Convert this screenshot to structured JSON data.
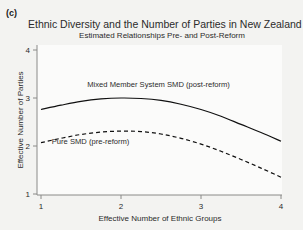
{
  "panel": {
    "label": "(c)"
  },
  "chart_data": {
    "type": "line",
    "title": "Ethnic Diversity and the Number of Parties in New Zealand",
    "subtitle": "Estimated Relationships Pre- and Post-Reform",
    "xlabel": "Effective Number of Ethnic Groups",
    "ylabel": "Effective Number of Parties",
    "xlim": [
      1,
      4
    ],
    "ylim": [
      1,
      4
    ],
    "xticks": [
      1,
      2,
      3,
      4
    ],
    "yticks": [
      1,
      2,
      3,
      4
    ],
    "xtick_labels": [
      "1",
      "2",
      "3",
      "4"
    ],
    "ytick_labels": [
      "1",
      "2",
      "3",
      "4"
    ],
    "grid": false,
    "legend_position": "inline-annotation",
    "series": [
      {
        "name": "Mixed Member System SMD (post-reform)",
        "style": "solid",
        "color": "#101010",
        "x": [
          1.0,
          1.25,
          1.5,
          1.75,
          2.0,
          2.25,
          2.5,
          2.75,
          3.0,
          3.25,
          3.5,
          3.75,
          4.0
        ],
        "values": [
          2.76,
          2.85,
          2.93,
          2.98,
          3.0,
          2.99,
          2.95,
          2.87,
          2.76,
          2.62,
          2.45,
          2.28,
          2.1
        ]
      },
      {
        "name": "Pure SMD (pre-reform)",
        "style": "dashed",
        "color": "#101010",
        "x": [
          1.0,
          1.25,
          1.5,
          1.75,
          2.0,
          2.25,
          2.5,
          2.75,
          3.0,
          3.25,
          3.5,
          3.75,
          4.0
        ],
        "values": [
          2.07,
          2.16,
          2.24,
          2.29,
          2.31,
          2.3,
          2.25,
          2.16,
          2.04,
          1.89,
          1.72,
          1.54,
          1.35
        ]
      }
    ],
    "annotations": [
      {
        "text": "Mixed Member System SMD (post-reform)",
        "x": 2.47,
        "y": 3.22
      },
      {
        "text": "Pure SMD (pre-reform)",
        "x": 1.62,
        "y": 2.05
      }
    ]
  }
}
